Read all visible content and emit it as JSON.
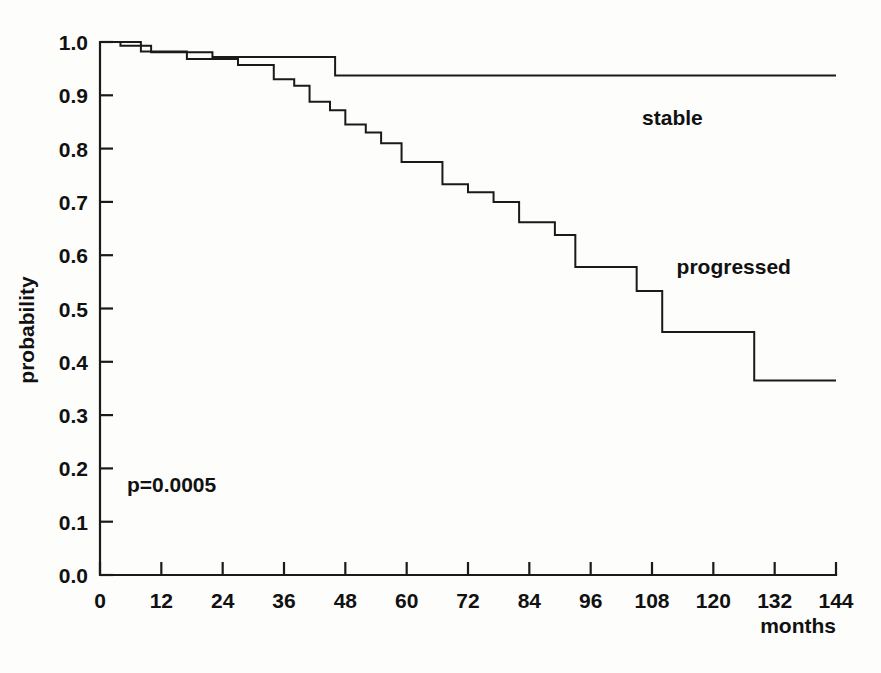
{
  "chart_data": {
    "type": "line",
    "subtype": "kaplan-meier-step",
    "title": "",
    "xlabel": "months",
    "ylabel": "probability",
    "xlim": [
      0,
      144
    ],
    "ylim": [
      0.0,
      1.0
    ],
    "grid": false,
    "legend_position": "inline-annotation",
    "x_ticks": [
      0,
      12,
      24,
      36,
      48,
      60,
      72,
      84,
      96,
      108,
      120,
      132,
      144
    ],
    "x_tick_labels": [
      "0",
      "12",
      "24",
      "36",
      "48",
      "60",
      "72",
      "84",
      "96",
      "108",
      "120",
      "132",
      "144"
    ],
    "y_ticks": [
      0.0,
      0.1,
      0.2,
      0.3,
      0.4,
      0.5,
      0.6,
      0.7,
      0.8,
      0.9,
      1.0
    ],
    "y_tick_labels": [
      "0.0",
      "0.1",
      "0.2",
      "0.3",
      "0.4",
      "0.5",
      "0.6",
      "0.7",
      "0.8",
      "0.9",
      "1.0"
    ],
    "annotations": [
      {
        "name": "p-value",
        "text": "p=0.0005",
        "x": 14,
        "y": 0.155
      },
      {
        "name": "stable-series-label",
        "text": "stable",
        "x": 112,
        "y": 0.845
      },
      {
        "name": "progressed-series-label",
        "text": "progressed",
        "x": 124,
        "y": 0.565
      }
    ],
    "series": [
      {
        "name": "stable",
        "label": "stable",
        "color": "#1a1a1a",
        "points": [
          [
            0,
            1.0
          ],
          [
            4,
            1.0
          ],
          [
            4,
            0.993
          ],
          [
            10,
            0.993
          ],
          [
            10,
            0.981
          ],
          [
            22,
            0.981
          ],
          [
            22,
            0.972
          ],
          [
            46,
            0.972
          ],
          [
            46,
            0.937
          ],
          [
            144,
            0.937
          ]
        ]
      },
      {
        "name": "progressed",
        "label": "progressed",
        "color": "#1a1a1a",
        "points": [
          [
            0,
            1.0
          ],
          [
            8,
            1.0
          ],
          [
            8,
            0.982
          ],
          [
            17,
            0.982
          ],
          [
            17,
            0.968
          ],
          [
            27,
            0.968
          ],
          [
            27,
            0.957
          ],
          [
            34,
            0.957
          ],
          [
            34,
            0.93
          ],
          [
            38,
            0.93
          ],
          [
            38,
            0.918
          ],
          [
            41,
            0.918
          ],
          [
            41,
            0.888
          ],
          [
            45,
            0.888
          ],
          [
            45,
            0.872
          ],
          [
            48,
            0.872
          ],
          [
            48,
            0.845
          ],
          [
            52,
            0.845
          ],
          [
            52,
            0.83
          ],
          [
            55,
            0.83
          ],
          [
            55,
            0.81
          ],
          [
            59,
            0.81
          ],
          [
            59,
            0.775
          ],
          [
            67,
            0.775
          ],
          [
            67,
            0.733
          ],
          [
            72,
            0.733
          ],
          [
            72,
            0.718
          ],
          [
            77,
            0.718
          ],
          [
            77,
            0.7
          ],
          [
            82,
            0.7
          ],
          [
            82,
            0.662
          ],
          [
            89,
            0.662
          ],
          [
            89,
            0.638
          ],
          [
            93,
            0.638
          ],
          [
            93,
            0.578
          ],
          [
            105,
            0.578
          ],
          [
            105,
            0.533
          ],
          [
            110,
            0.533
          ],
          [
            110,
            0.456
          ],
          [
            128,
            0.456
          ],
          [
            128,
            0.365
          ],
          [
            144,
            0.365
          ]
        ]
      }
    ]
  },
  "caption": {
    "partial_text": ""
  }
}
